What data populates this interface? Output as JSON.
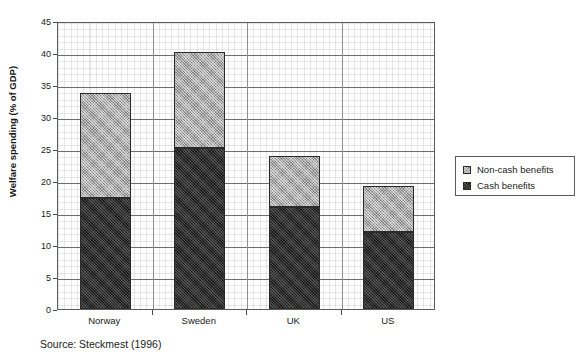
{
  "figure": {
    "title_remnant": "",
    "source_note": "Source: Steckmest (1996)"
  },
  "legend": {
    "entries": [
      {
        "label": "Non-cash benefits",
        "swatch": "noncash-swatch",
        "color": "#a8a8a8"
      },
      {
        "label": "Cash benefits",
        "swatch": "cash-swatch",
        "color": "#2b2b2b"
      }
    ]
  },
  "chart_data": {
    "type": "bar",
    "stacked": true,
    "title": "",
    "xlabel": "",
    "ylabel": "Welfare spending (% of GDP)",
    "categories": [
      "Norway",
      "Sweden",
      "UK",
      "US"
    ],
    "series": [
      {
        "name": "Cash benefits",
        "color": "#2b2b2b",
        "values": [
          17.3,
          25.2,
          16.0,
          12.0
        ]
      },
      {
        "name": "Non-cash benefits",
        "color": "#a8a8a8",
        "values": [
          16.4,
          15.0,
          7.9,
          7.2
        ]
      }
    ],
    "totals": [
      33.7,
      40.2,
      23.9,
      19.2
    ],
    "ylim": [
      0,
      45
    ],
    "yticks": [
      0,
      5,
      10,
      15,
      20,
      25,
      30,
      35,
      40,
      45
    ],
    "ytick_labels": [
      "0",
      "5",
      "10",
      "15",
      "20",
      "25",
      "30",
      "35",
      "40",
      "45"
    ],
    "grid": true,
    "legend_position": "right"
  }
}
